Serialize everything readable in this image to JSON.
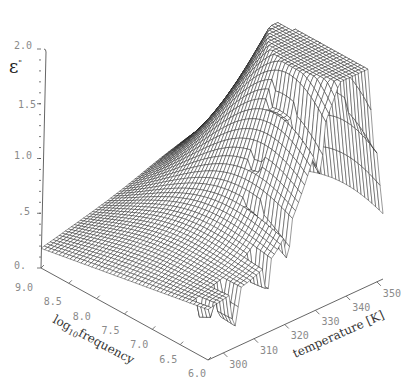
{
  "chart_data": {
    "type": "surface3d",
    "title": "",
    "z_label": "ε\"",
    "x_label": "log10frequency",
    "x_label_parts": {
      "base": "log",
      "subscript": "10",
      "rest": "frequency"
    },
    "y_label": "temperature [K]",
    "z_ticks": [
      "2.0",
      "1.5",
      "1.0",
      ".5",
      "0."
    ],
    "z_tick_values": [
      2.0,
      1.5,
      1.0,
      0.5,
      0.0
    ],
    "x_ticks": [
      "9.0",
      "8.5",
      "8.0",
      "7.5",
      "7.0",
      "6.5",
      "6.0"
    ],
    "x_tick_values": [
      9.0,
      8.5,
      8.0,
      7.5,
      7.0,
      6.5,
      6.0
    ],
    "y_ticks": [
      "300",
      "310",
      "320",
      "330",
      "340",
      "350"
    ],
    "y_tick_values": [
      300,
      310,
      320,
      330,
      340,
      350
    ],
    "x_range": [
      6.0,
      9.0
    ],
    "y_range": [
      295,
      352
    ],
    "z_range": [
      0.0,
      2.0
    ],
    "peaks": [
      {
        "label": "left-ridge-peak",
        "log10frequency": 6.4,
        "temperature": 338,
        "value": 1.82
      },
      {
        "label": "right-ridge-peak",
        "log10frequency": 6.2,
        "temperature": 346,
        "value": 1.95
      }
    ],
    "edge_values": {
      "corner_9.0_295K": 0.2,
      "front_edge_at_freq_7.0": 0.85,
      "back_edge_at_freq_9.0_350K": 1.0
    },
    "grid": false,
    "legend": "none"
  }
}
